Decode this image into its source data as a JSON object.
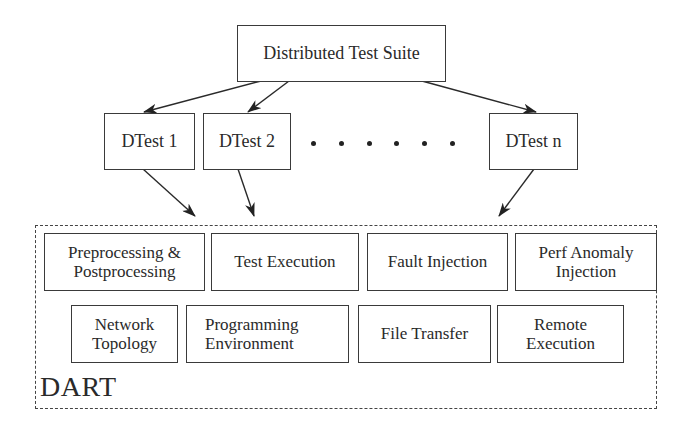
{
  "diagram": {
    "root": {
      "label": "Distributed Test Suite"
    },
    "tests": [
      {
        "label": "DTest 1"
      },
      {
        "label": "DTest 2"
      },
      {
        "label": "DTest n"
      }
    ],
    "ellipsis_dots": 6,
    "framework": {
      "label": "DART",
      "row1": [
        {
          "line1": "Preprocessing &",
          "line2": "Postprocessing"
        },
        {
          "line1": "Test Execution",
          "line2": ""
        },
        {
          "line1": "Fault Injection",
          "line2": ""
        },
        {
          "line1": "Perf Anomaly",
          "line2": "Injection"
        }
      ],
      "row2": [
        {
          "line1": "Network",
          "line2": "Topology"
        },
        {
          "line1": "Programming",
          "line2": "Environment"
        },
        {
          "line1": "File Transfer",
          "line2": ""
        },
        {
          "line1": "Remote",
          "line2": "Execution"
        }
      ]
    },
    "edges": [
      {
        "from": "Distributed Test Suite",
        "to": "DTest 1"
      },
      {
        "from": "Distributed Test Suite",
        "to": "DTest 2"
      },
      {
        "from": "Distributed Test Suite",
        "to": "DTest n"
      },
      {
        "from": "DTest 1",
        "to": "DART"
      },
      {
        "from": "DTest 2",
        "to": "DART"
      },
      {
        "from": "DTest n",
        "to": "DART"
      }
    ],
    "colors": {
      "stroke": "#3a3a3a",
      "background": "#ffffff"
    }
  }
}
